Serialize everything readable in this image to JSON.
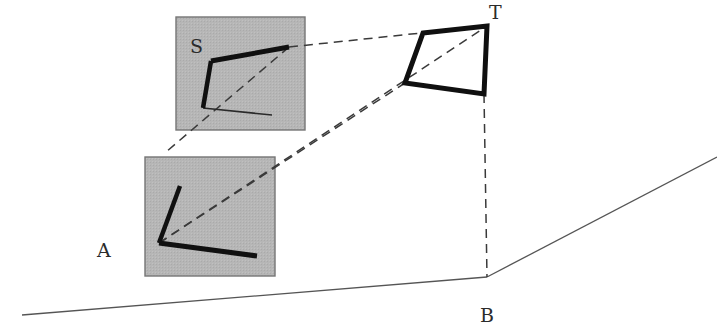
{
  "figure": {
    "title": "",
    "canvas": {
      "width": 717,
      "height": 330,
      "background": "#ffffff"
    },
    "colors": {
      "patch_fill": "#b6b6b6",
      "patch_stroke": "#757575",
      "thick_stroke": "#101010",
      "thin_stroke": "#555555",
      "dashed_stroke": "#404040",
      "label_color": "#2b2b2b"
    },
    "labels": [
      {
        "name": "label-A",
        "text": "A",
        "x": 97,
        "y": 257
      },
      {
        "name": "label-B",
        "text": "B",
        "x": 480,
        "y": 322
      },
      {
        "name": "label-S",
        "text": "S",
        "x": 190,
        "y": 53
      },
      {
        "name": "label-T",
        "text": "T",
        "x": 489,
        "y": 19
      }
    ],
    "patches": [
      {
        "name": "patch-S",
        "label": "S",
        "x": 176,
        "y": 17,
        "width": 129,
        "height": 113,
        "fill": "#b6b6b6",
        "stroke": "#757575"
      },
      {
        "name": "patch-A",
        "label": "A",
        "x": 145,
        "y": 157,
        "width": 130,
        "height": 119,
        "fill": "#b6b6b6",
        "stroke": "#757575"
      }
    ],
    "ground_lines": [
      {
        "name": "ground-line-left",
        "x1": 22,
        "y1": 315,
        "x2": 487,
        "y2": 277
      },
      {
        "name": "ground-line-right",
        "x1": 487,
        "y1": 277,
        "x2": 717,
        "y2": 157
      }
    ],
    "quadrilateral_T": {
      "name": "quad-T",
      "points": [
        [
          423,
          33
        ],
        [
          487,
          26
        ],
        [
          484,
          94
        ],
        [
          405,
          83
        ]
      ],
      "closed": true
    },
    "corner_S": {
      "name": "corner-S-thick",
      "vertex": [
        203,
        108
      ],
      "arm_up": [
        211,
        61
      ],
      "arm_right": [
        289,
        47
      ],
      "thin_arm": [
        272,
        115
      ]
    },
    "corner_A": {
      "name": "corner-A-thick",
      "vertex": [
        159,
        243
      ],
      "arm_up": [
        180,
        186
      ],
      "arm_right": [
        257,
        256
      ]
    },
    "dashed_lines": [
      {
        "name": "dashed-ray-S-through-box",
        "x1": 166,
        "y1": 152,
        "x2": 289,
        "y2": 47
      },
      {
        "name": "dashed-ray-S-to-T",
        "x1": 289,
        "y1": 47,
        "x2": 487,
        "y2": 26
      },
      {
        "name": "dashed-ray-A-to-T-top",
        "x1": 159,
        "y1": 243,
        "x2": 487,
        "y2": 26
      },
      {
        "name": "dashed-ray-A-to-T-bottom",
        "x1": 159,
        "y1": 243,
        "x2": 405,
        "y2": 83
      },
      {
        "name": "dashed-vertical-T-to-B",
        "x1": 484,
        "y1": 94,
        "x2": 487,
        "y2": 277
      },
      {
        "name": "dashed-ray-S-down-left",
        "x1": 203,
        "y1": 108,
        "x2": 166,
        "y2": 152
      }
    ]
  }
}
